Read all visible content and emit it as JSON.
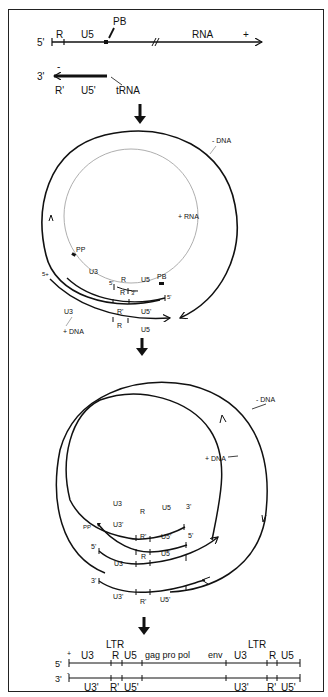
{
  "step1": {
    "rna_strand": {
      "five_prime": "5'",
      "r": "R",
      "u5": "U5",
      "pb": "PB",
      "rna": "RNA",
      "polarity": "+"
    },
    "trna_strand": {
      "three_prime": "3'",
      "polarity": "-",
      "r_prime": "R'",
      "u5_prime": "U5'",
      "trna": "tRNA"
    }
  },
  "step2": {
    "minus_dna": "- DNA",
    "plus_rna": "+ RNA",
    "pp": "PP",
    "u3_inner": "U3",
    "five_prime_a": "5'",
    "r_a": "R",
    "u5_a": "U5",
    "pb": "PB",
    "r_b": "R",
    "three_prime_b": "3'",
    "five_prime_plus": "5+",
    "five_prime_c": "5'",
    "r_prime_c": "R'",
    "u5_prime_c": "U5'",
    "u3_outer": "U3",
    "plus_dna": "+ DNA",
    "r_d": "R",
    "u5_d": "U5"
  },
  "step3": {
    "minus_dna": "- DNA",
    "plus_dna": "+ DNA",
    "row1": {
      "u3": "U3",
      "r": "R",
      "u5": "U5",
      "end": "3'"
    },
    "row2": {
      "pp": "PP",
      "u3": "U3'",
      "r": "R'",
      "u5": "U5'",
      "end": "5'"
    },
    "row3": {
      "start": "5'",
      "u3": "U3",
      "r": "R",
      "u5": "U5"
    },
    "row4": {
      "start": "3'",
      "u3": "U3'",
      "r": "R'",
      "u5": "U5'"
    }
  },
  "step4": {
    "ltr_left": "LTR",
    "ltr_right": "LTR",
    "top_strand": {
      "five_prime": "5'",
      "polarity": "+",
      "u3a": "U3",
      "ra": "R",
      "u5a": "U5",
      "genes": "gag pro pol",
      "env": "env",
      "u3b": "U3",
      "rb": "R",
      "u5b": "U5"
    },
    "bottom_strand": {
      "three_prime": "3'",
      "polarity": "-",
      "u3a": "U3'",
      "ra": "R'",
      "u5a": "U5'",
      "u3b": "U3'",
      "rb": "R'",
      "u5b": "U5'"
    }
  }
}
